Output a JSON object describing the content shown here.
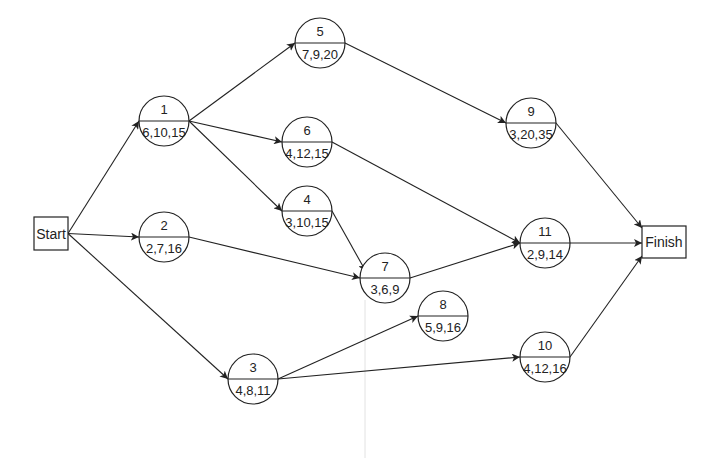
{
  "diagram": {
    "type": "PERT activity network",
    "start": {
      "label": "Start",
      "x": 34,
      "y": 217,
      "w": 34,
      "h": 33
    },
    "finish": {
      "label": "Finish",
      "x": 642,
      "y": 226,
      "w": 44,
      "h": 32
    },
    "node_radius": 25,
    "nodes": [
      {
        "id": "1",
        "times": "6,10,15",
        "cx": 164,
        "cy": 121
      },
      {
        "id": "2",
        "times": "2,7,16",
        "cx": 164,
        "cy": 237
      },
      {
        "id": "3",
        "times": "4,8,11",
        "cx": 253,
        "cy": 379
      },
      {
        "id": "4",
        "times": "3,10,15",
        "cx": 307,
        "cy": 211
      },
      {
        "id": "5",
        "times": "7,9,20",
        "cx": 320,
        "cy": 43
      },
      {
        "id": "6",
        "times": "4,12,15",
        "cx": 307,
        "cy": 142
      },
      {
        "id": "7",
        "times": "3,6,9",
        "cx": 385,
        "cy": 278
      },
      {
        "id": "8",
        "times": "5,9,16",
        "cx": 443,
        "cy": 316
      },
      {
        "id": "9",
        "times": "3,20,35",
        "cx": 531,
        "cy": 123
      },
      {
        "id": "10",
        "times": "4,12,16",
        "cx": 545,
        "cy": 357
      },
      {
        "id": "11",
        "times": "2,9,14",
        "cx": 545,
        "cy": 243
      }
    ],
    "edges": [
      {
        "from": "Start",
        "to": "1"
      },
      {
        "from": "Start",
        "to": "2"
      },
      {
        "from": "Start",
        "to": "3"
      },
      {
        "from": "1",
        "to": "5"
      },
      {
        "from": "1",
        "to": "6"
      },
      {
        "from": "1",
        "to": "4"
      },
      {
        "from": "2",
        "to": "7"
      },
      {
        "from": "4",
        "to": "7"
      },
      {
        "from": "5",
        "to": "9"
      },
      {
        "from": "6",
        "to": "11"
      },
      {
        "from": "7",
        "to": "11"
      },
      {
        "from": "3",
        "to": "8"
      },
      {
        "from": "3",
        "to": "10"
      },
      {
        "from": "9",
        "to": "Finish"
      },
      {
        "from": "11",
        "to": "Finish"
      },
      {
        "from": "10",
        "to": "Finish"
      }
    ],
    "colors": {
      "stroke": "#222222",
      "background": "#ffffff",
      "guide": "#e2e2e2"
    }
  }
}
